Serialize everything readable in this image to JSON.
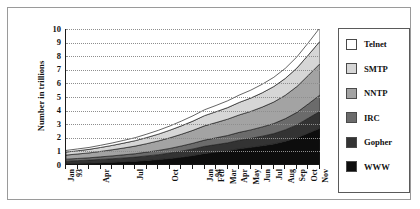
{
  "chart_data": {
    "type": "area",
    "title": "",
    "xlabel": "",
    "ylabel": "Number in trillions",
    "ylim": [
      0,
      10
    ],
    "ytick_labels": [
      "0",
      "1",
      "2",
      "3",
      "4",
      "5",
      "6",
      "7",
      "8",
      "9",
      "10"
    ],
    "grid": true,
    "legend_position": "right",
    "stacked": true,
    "categories": [
      "Jan 93",
      "Feb",
      "Mar",
      "Apr",
      "May",
      "Jun",
      "Jul",
      "Aug",
      "Sep",
      "Oct",
      "Nov",
      "Dec",
      "Jan 94",
      "Feb",
      "Mar",
      "Apr",
      "May",
      "Jun",
      "Jul",
      "Aug",
      "Sep",
      "Oct",
      "Nov"
    ],
    "x_tick_labels": [
      "Jan 93",
      "",
      "",
      "Apr",
      "",
      "",
      "Jul",
      "",
      "",
      "Oct",
      "",
      "",
      "Jan 94",
      "Feb",
      "Mar",
      "Apr",
      "May",
      "Jun",
      "Jul",
      "Aug",
      "Sep",
      "Oct",
      "Nov"
    ],
    "series": [
      {
        "name": "WWW",
        "color": "#0d0d0d",
        "values": [
          0.1,
          0.12,
          0.14,
          0.17,
          0.2,
          0.24,
          0.28,
          0.34,
          0.4,
          0.48,
          0.58,
          0.7,
          0.85,
          0.95,
          1.05,
          1.2,
          1.3,
          1.42,
          1.55,
          1.75,
          2.0,
          2.35,
          2.7
        ]
      },
      {
        "name": "Gopher",
        "color": "#333333",
        "values": [
          0.18,
          0.2,
          0.22,
          0.24,
          0.26,
          0.28,
          0.3,
          0.33,
          0.36,
          0.4,
          0.44,
          0.48,
          0.52,
          0.55,
          0.58,
          0.62,
          0.66,
          0.7,
          0.76,
          0.84,
          0.95,
          1.1,
          1.25
        ]
      },
      {
        "name": "IRC",
        "color": "#6b6b6b",
        "values": [
          0.15,
          0.16,
          0.17,
          0.19,
          0.21,
          0.23,
          0.25,
          0.28,
          0.31,
          0.34,
          0.38,
          0.42,
          0.46,
          0.5,
          0.54,
          0.58,
          0.62,
          0.68,
          0.74,
          0.82,
          0.92,
          1.05,
          1.2
        ]
      },
      {
        "name": "NNTP",
        "color": "#a3a3a3",
        "values": [
          0.3,
          0.33,
          0.36,
          0.4,
          0.45,
          0.5,
          0.56,
          0.62,
          0.7,
          0.78,
          0.86,
          0.95,
          1.05,
          1.12,
          1.2,
          1.28,
          1.36,
          1.46,
          1.58,
          1.72,
          1.9,
          2.1,
          2.3
        ]
      },
      {
        "name": "SMTP",
        "color": "#d6d6d6",
        "values": [
          0.22,
          0.24,
          0.26,
          0.29,
          0.32,
          0.36,
          0.4,
          0.45,
          0.5,
          0.56,
          0.62,
          0.68,
          0.75,
          0.8,
          0.85,
          0.92,
          0.98,
          1.05,
          1.14,
          1.24,
          1.36,
          1.5,
          1.65
        ]
      },
      {
        "name": "Telnet",
        "color": "#ffffff",
        "values": [
          0.12,
          0.13,
          0.14,
          0.16,
          0.18,
          0.2,
          0.22,
          0.25,
          0.28,
          0.31,
          0.35,
          0.39,
          0.43,
          0.46,
          0.5,
          0.54,
          0.58,
          0.63,
          0.68,
          0.74,
          0.82,
          0.9,
          1.0
        ]
      }
    ]
  },
  "legend": {
    "items": [
      {
        "label": "Telnet",
        "color": "#ffffff"
      },
      {
        "label": "SMTP",
        "color": "#d6d6d6"
      },
      {
        "label": "NNTP",
        "color": "#a3a3a3"
      },
      {
        "label": "IRC",
        "color": "#6b6b6b"
      },
      {
        "label": "Gopher",
        "color": "#333333"
      },
      {
        "label": "WWW",
        "color": "#0d0d0d"
      }
    ]
  }
}
